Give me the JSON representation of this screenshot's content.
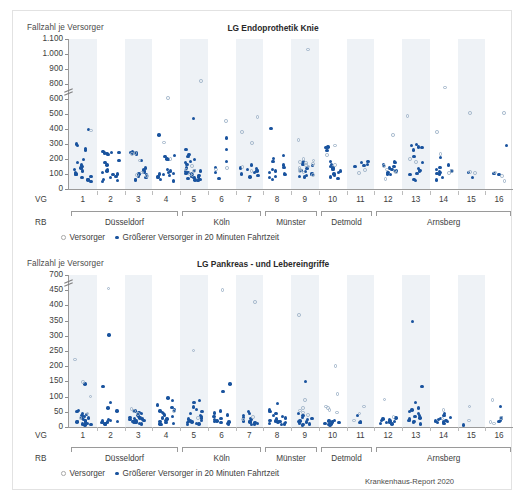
{
  "figure": {
    "source_note": "Krankenhaus-Report 2020",
    "accent_color": "#19539e",
    "hollow_color": "#9fb4c9",
    "band_color": "#eef2f6"
  },
  "legend": {
    "hollow_label": "Versorger",
    "filled_label": "Größerer Versorger in 20 Minuten Fahrtzeit",
    "hollow_icon": "hollow-circle-icon",
    "filled_icon": "filled-circle-icon"
  },
  "axis_labels": {
    "y_caption": "Fallzahl je Versorger",
    "vg_caption": "VG",
    "rb_caption": "RB"
  },
  "vg_categories": [
    "1",
    "2",
    "3",
    "4",
    "5",
    "6",
    "7",
    "8",
    "9",
    "10",
    "11",
    "12",
    "13",
    "14",
    "15",
    "16"
  ],
  "regions": [
    {
      "name": "Düsseldorf",
      "from": 1,
      "to": 4
    },
    {
      "name": "Köln",
      "from": 5,
      "to": 7
    },
    {
      "name": "Münster",
      "from": 8,
      "to": 9
    },
    {
      "name": "Detmold",
      "from": 10,
      "to": 11
    },
    {
      "name": "Arnsberg",
      "from": 12,
      "to": 16
    }
  ],
  "chart_data": [
    {
      "type": "scatter",
      "title": "LG Endoprothetik Knie",
      "xlabel": "VG",
      "ylabel": "Fallzahl je Versorger",
      "yticks": [
        "0",
        "100",
        "200",
        "300",
        "400",
        "500",
        "600",
        "800",
        "900",
        "1.000",
        "1.100"
      ],
      "ytick_values": [
        0,
        100,
        200,
        300,
        400,
        500,
        600,
        800,
        900,
        1000,
        1100
      ],
      "axis_break_between": [
        600,
        800
      ],
      "ylim": [
        0,
        1100
      ],
      "grid": false,
      "legend_position": "bottom-left",
      "categories": [
        "1",
        "2",
        "3",
        "4",
        "5",
        "6",
        "7",
        "8",
        "9",
        "10",
        "11",
        "12",
        "13",
        "14",
        "15",
        "16"
      ],
      "series": [
        {
          "name": "Größerer Versorger in 20 Minuten Fahrtzeit",
          "marker": "filled",
          "points_by_category": {
            "1": [
              395,
              300,
              290,
              270,
              260,
              195,
              175,
              160,
              150,
              140,
              130,
              120,
              110,
              100,
              95,
              85,
              75,
              65,
              60,
              50
            ],
            "2": [
              250,
              245,
              245,
              240,
              235,
              230,
              190,
              175,
              160,
              130,
              120,
              110,
              100,
              95,
              85,
              75,
              65,
              55,
              50
            ],
            "3": [
              250,
              245,
              240,
              235,
              230,
              190,
              140,
              130,
              120,
              110,
              100,
              95,
              85,
              75,
              65,
              60
            ],
            "4": [
              360,
              225,
              215,
              200,
              195,
              130,
              120,
              110,
              105,
              100,
              95,
              90,
              85,
              75,
              65,
              55,
              50
            ],
            "5": [
              470,
              265,
              230,
              215,
              195,
              185,
              175,
              165,
              140,
              125,
              120,
              115,
              110,
              105,
              100,
              95,
              90,
              85,
              80,
              75,
              70,
              65,
              60,
              55
            ],
            "6": [
              340,
              265,
              185,
              145,
              110,
              70
            ],
            "7": [
              160,
              140,
              135,
              130,
              125,
              120,
              110,
              100,
              90,
              80
            ],
            "8": [
              405,
              225,
              205,
              185,
              160,
              145,
              130,
              120,
              110,
              100,
              95,
              85,
              75,
              65
            ],
            "9": [
              185,
              175,
              165,
              155,
              145,
              135,
              125,
              115,
              105,
              95,
              90,
              85,
              80
            ],
            "10": [
              280,
              275,
              255,
              185,
              165,
              150,
              140,
              130,
              120,
              110,
              100,
              90,
              80,
              70
            ],
            "11": [
              185,
              175,
              165,
              155,
              150
            ],
            "12": [
              185,
              175,
              160,
              150,
              140,
              130,
              120,
              110,
              100,
              95
            ],
            "13": [
              295,
              290,
              280,
              275,
              260,
              215,
              175,
              135,
              125,
              115,
              105,
              95,
              65,
              55
            ],
            "14": [
              210,
              160,
              145,
              130,
              120,
              115,
              110,
              105,
              100,
              75,
              60
            ],
            "15": [
              110,
              75
            ],
            "16": [
              290,
              105,
              95
            ]
          }
        },
        {
          "name": "Versorger",
          "marker": "hollow",
          "points_by_category": {
            "1": [
              390
            ],
            "2": [],
            "3": [
              240,
              235,
              190,
              110,
              95,
              85
            ],
            "4": [
              610,
              310,
              200
            ],
            "5": [
              820,
              155,
              130,
              120,
              100,
              90
            ],
            "6": [
              455,
              140,
              130
            ],
            "7": [
              480,
              380,
              305,
              145,
              120
            ],
            "8": [],
            "9": [
              1030,
              325,
              200,
              190,
              180,
              175,
              165,
              160,
              150,
              140,
              130,
              120,
              110,
              95
            ],
            "10": [
              290,
              225,
              160
            ],
            "11": [
              125,
              105
            ],
            "12": [
              360,
              155,
              130,
              120,
              110,
              65
            ],
            "13": [
              485,
              200,
              180
            ],
            "14": [
              755,
              380,
              235,
              120,
              105
            ],
            "15": [
              505,
              115,
              105
            ],
            "16": [
              505,
              110,
              85,
              55
            ]
          }
        }
      ]
    },
    {
      "type": "scatter",
      "title": "LG Pankreas - und Lebereingriffe",
      "xlabel": "VG",
      "ylabel": "Fallzahl je Versorger",
      "yticks": [
        "0",
        "50",
        "100",
        "150",
        "200",
        "250",
        "300",
        "350",
        "400",
        "450",
        "700"
      ],
      "ytick_values": [
        0,
        50,
        100,
        150,
        200,
        250,
        300,
        350,
        400,
        450,
        700
      ],
      "axis_break_between": [
        450,
        700
      ],
      "ylim": [
        0,
        700
      ],
      "grid": false,
      "legend_position": "bottom-left",
      "categories": [
        "1",
        "2",
        "3",
        "4",
        "5",
        "6",
        "7",
        "8",
        "9",
        "10",
        "11",
        "12",
        "13",
        "14",
        "15",
        "16"
      ],
      "series": [
        {
          "name": "Größerer Versorger in 20 Minuten Fahrtzeit",
          "marker": "filled",
          "points_by_category": {
            "1": [
              142,
              55,
              50,
              45,
              42,
              38,
              35,
              32,
              30,
              28,
              25,
              22,
              20,
              18,
              16,
              14,
              12,
              10,
              8,
              6
            ],
            "2": [
              302,
              133,
              80,
              62,
              52,
              25,
              22,
              20,
              18,
              16,
              14,
              12,
              10,
              8
            ],
            "3": [
              52,
              48,
              44,
              40,
              36,
              32,
              30,
              28,
              26,
              24,
              22,
              20,
              18,
              16,
              14,
              12,
              10
            ],
            "4": [
              96,
              88,
              72,
              64,
              56,
              52,
              48,
              44,
              40,
              34,
              30,
              26,
              22,
              18,
              14,
              12,
              10,
              8
            ],
            "5": [
              88,
              80,
              66,
              58,
              50,
              44,
              38,
              34,
              30,
              26,
              22,
              20,
              18,
              16,
              14,
              12,
              10,
              8
            ],
            "6": [
              141,
              117,
              52,
              46,
              40,
              34,
              28,
              24,
              20,
              18,
              16,
              14,
              12,
              10
            ],
            "7": [
              50,
              44,
              38,
              32,
              28,
              24,
              20,
              18,
              16,
              14,
              12,
              10,
              8
            ],
            "8": [
              78,
              56,
              50,
              44,
              38,
              34,
              30,
              26,
              22,
              20,
              18,
              16,
              14,
              12,
              10,
              8
            ],
            "9": [
              150,
              44,
              38,
              32,
              28,
              24,
              20,
              18,
              16,
              14,
              12,
              10,
              8,
              6
            ],
            "10": [
              22,
              20,
              18,
              16,
              14,
              12,
              10,
              8,
              6
            ],
            "11": [
              38,
              16,
              14
            ],
            "12": [
              30,
              26,
              24,
              22,
              20,
              18,
              16,
              14,
              12,
              10
            ],
            "13": [
              348,
              133,
              80,
              62,
              56,
              50,
              44,
              38,
              34,
              30,
              26,
              22,
              18,
              14,
              10
            ],
            "14": [
              44,
              38,
              32,
              28,
              24,
              22,
              20,
              18,
              16,
              14,
              12
            ],
            "15": [
              6
            ],
            "16": [
              68,
              30,
              22,
              18
            ]
          }
        },
        {
          "name": "Versorger",
          "marker": "hollow",
          "points_by_category": {
            "1": [
              222,
              148,
              100,
              44,
              30
            ],
            "2": [
              480
            ],
            "3": [
              60,
              52,
              42
            ],
            "4": [
              52
            ],
            "5": [
              252,
              30
            ],
            "6": [
              458
            ],
            "7": [
              412,
              32,
              24
            ],
            "8": [],
            "9": [
              368,
              88,
              62,
              54,
              48,
              40
            ],
            "10": [
              200,
              108,
              68,
              62,
              56,
              48
            ],
            "11": [
              68,
              44,
              22
            ],
            "12": [
              90,
              32
            ],
            "13": [],
            "14": [
              56,
              28
            ],
            "15": [
              68,
              22
            ],
            "16": [
              88,
              30,
              16,
              12
            ]
          }
        }
      ]
    }
  ]
}
